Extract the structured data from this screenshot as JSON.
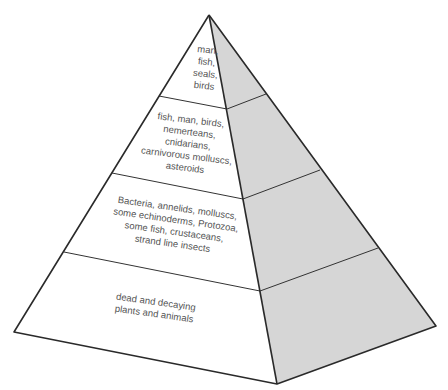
{
  "diagram": {
    "type": "trophic pyramid",
    "colors": {
      "left_face": "#ffffff",
      "right_face": "#d6d6d6",
      "edge": "#2a2a2a",
      "text": "#555555"
    },
    "levels": [
      {
        "id": "level-4-top",
        "lines": [
          "man,",
          "fish,",
          "seals,",
          "birds"
        ]
      },
      {
        "id": "level-3",
        "lines": [
          "fish, man, birds,",
          "nemerteans,",
          "cnidarians,",
          "carnivorous molluscs,",
          "asteroids"
        ]
      },
      {
        "id": "level-2",
        "lines": [
          "Bacteria, annelids, molluscs,",
          "some echinoderms, Protozoa,",
          "some fish, crustaceans,",
          "strand line insects"
        ]
      },
      {
        "id": "level-1-base",
        "lines": [
          "dead and decaying",
          "plants and animals"
        ]
      }
    ]
  }
}
